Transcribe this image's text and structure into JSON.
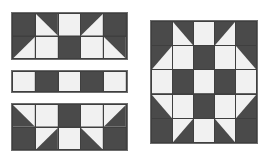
{
  "figure": {
    "background_color": "#ffffff"
  },
  "colors": {
    "dark": "#4a4a4a",
    "light": "#f1f1f1",
    "seam": "#6d6d6d",
    "outline": "#7a7a7a"
  },
  "legend": {
    "dark_label": "dark fabric",
    "light_label": "light fabric"
  },
  "chart_data": {
    "type": "heatmap",
    "xlabel": "",
    "ylabel": "",
    "grid": true,
    "legend_position": "none",
    "patch_codes": {
      "D": "solid dark square",
      "L": "solid light square",
      "TL": "half-square triangle, dark in top-left corner",
      "TR": "half-square triangle, dark in top-right corner",
      "BL": "half-square triangle, dark in bottom-left corner",
      "BR": "half-square triangle, dark in bottom-right corner"
    },
    "units": {
      "columns": 5,
      "assembled_rows": 5
    },
    "pieces": [
      {
        "name": "strip-row-1",
        "label": "top strip",
        "columns": 5,
        "rows": 2,
        "cells": [
          [
            "D",
            "TR",
            "L",
            "TL",
            "D"
          ],
          [
            "TL",
            "L",
            "D",
            "L",
            "TR"
          ]
        ]
      },
      {
        "name": "strip-row-2",
        "label": "middle strip",
        "columns": 5,
        "rows": 1,
        "cells": [
          [
            "L",
            "D",
            "L",
            "D",
            "L"
          ]
        ]
      },
      {
        "name": "strip-row-3",
        "label": "bottom strip",
        "columns": 5,
        "rows": 2,
        "cells": [
          [
            "BL",
            "L",
            "D",
            "L",
            "BR"
          ],
          [
            "D",
            "BR",
            "L",
            "BL",
            "D"
          ]
        ]
      },
      {
        "name": "assembled-block",
        "label": "assembled block",
        "columns": 5,
        "rows": 5,
        "cells": [
          [
            "D",
            "TR",
            "L",
            "TL",
            "D"
          ],
          [
            "TL",
            "L",
            "D",
            "L",
            "TR"
          ],
          [
            "L",
            "D",
            "L",
            "D",
            "L"
          ],
          [
            "BL",
            "L",
            "D",
            "L",
            "BR"
          ],
          [
            "D",
            "BR",
            "L",
            "BL",
            "D"
          ]
        ]
      }
    ]
  }
}
